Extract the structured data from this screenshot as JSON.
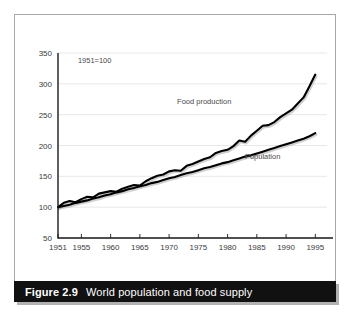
{
  "caption": {
    "figure_number": "Figure 2.9",
    "title": "World population and food supply"
  },
  "chart_data": {
    "type": "line",
    "title": "World population and food supply",
    "xlabel": "",
    "ylabel": "",
    "note": "1951=100",
    "grid": true,
    "legend_position": "inline-annotation",
    "xlim": [
      1951,
      1997
    ],
    "ylim": [
      50,
      350
    ],
    "xticks": [
      1951,
      1955,
      1960,
      1965,
      1970,
      1975,
      1980,
      1985,
      1990,
      1995
    ],
    "xtick_labels": [
      "1951",
      "1955",
      "1960",
      "1965",
      "1970",
      "1975",
      "1980",
      "1985",
      "1990",
      "1995"
    ],
    "yticks": [
      50,
      100,
      150,
      200,
      250,
      300,
      350
    ],
    "ytick_labels": [
      "50",
      "100",
      "150",
      "200",
      "250",
      "300",
      "350"
    ],
    "x": [
      1951,
      1952,
      1953,
      1954,
      1955,
      1956,
      1957,
      1958,
      1959,
      1960,
      1961,
      1962,
      1963,
      1964,
      1965,
      1966,
      1967,
      1968,
      1969,
      1970,
      1971,
      1972,
      1973,
      1974,
      1975,
      1976,
      1977,
      1978,
      1979,
      1980,
      1981,
      1982,
      1983,
      1984,
      1985,
      1986,
      1987,
      1988,
      1989,
      1990,
      1991,
      1992,
      1993,
      1994,
      1995
    ],
    "series": [
      {
        "name": "Food production",
        "color": "#000000",
        "label_x": 1976,
        "label_y": 268,
        "values": [
          100,
          107,
          110,
          108,
          113,
          117,
          116,
          122,
          124,
          126,
          125,
          130,
          133,
          136,
          135,
          142,
          147,
          151,
          153,
          158,
          160,
          159,
          167,
          170,
          174,
          178,
          181,
          188,
          191,
          193,
          199,
          208,
          206,
          216,
          224,
          232,
          233,
          238,
          246,
          252,
          258,
          268,
          278,
          296,
          315
        ]
      },
      {
        "name": "Population",
        "color": "#000000",
        "label_x": 1986,
        "label_y": 178,
        "values": [
          100,
          102,
          104,
          107,
          109,
          111,
          114,
          116,
          119,
          121,
          124,
          126,
          129,
          131,
          134,
          136,
          139,
          141,
          144,
          147,
          149,
          152,
          155,
          157,
          160,
          163,
          165,
          168,
          171,
          173,
          176,
          179,
          182,
          184,
          187,
          190,
          193,
          196,
          199,
          202,
          205,
          208,
          211,
          215,
          220
        ]
      }
    ]
  }
}
